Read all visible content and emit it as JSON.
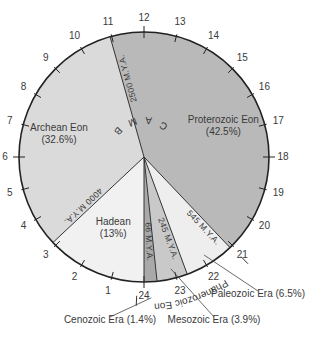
{
  "diagram": {
    "type": "geologic-time-clock",
    "orientation": "rotated-180",
    "colors": {
      "hadean": "#f1f1f1",
      "archean": "#dadada",
      "proterozoic": "#b9b9b9",
      "paleozoic": "#eeeeee",
      "mesozoic": "#c9c9c9",
      "cenozoic": "#a9a9a9",
      "outline": "#222222"
    },
    "clock_hours": [
      "1",
      "2",
      "3",
      "4",
      "5",
      "6",
      "7",
      "8",
      "9",
      "10",
      "11",
      "12",
      "13",
      "14",
      "15",
      "16",
      "17",
      "18",
      "19",
      "20",
      "21",
      "22",
      "23",
      "24"
    ],
    "eons": [
      {
        "name": "Hadean",
        "percent": "(13%)"
      },
      {
        "name": "Archean Eon",
        "percent": "(32.6%)"
      },
      {
        "name": "Proterozoic Eon",
        "percent": "(42.5%)"
      }
    ],
    "boundaries": [
      {
        "label": "4000 M.Y.A."
      },
      {
        "label": "2500 M.Y.A."
      },
      {
        "label": "545 M.Y.A."
      },
      {
        "label": "245 M.Y.A."
      },
      {
        "label": "66 M.Y.A."
      }
    ],
    "supereon": "P R E C A M B R I A N",
    "phanerozoic_label": "Phanerozoic Eon",
    "eras": [
      {
        "name": "Paleozoic Era (6.5%)"
      },
      {
        "name": "Mesozoic Era (3.9%)"
      },
      {
        "name": "Cenozoic Era (1.4%)"
      }
    ]
  }
}
